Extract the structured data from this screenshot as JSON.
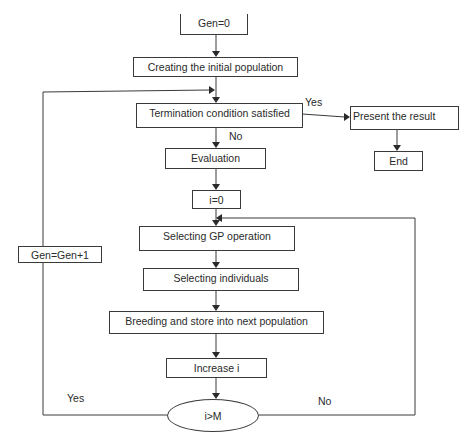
{
  "diagram": {
    "type": "flowchart",
    "nodes": {
      "gen_init": "Gen=0",
      "create_pop": "Creating the initial population",
      "termination": "Termination condition satisfied",
      "present": "Present the result",
      "end": "End",
      "evaluation": "Evaluation",
      "i_init": "i=0",
      "select_op": "Selecting GP operation",
      "select_ind": "Selecting individuals",
      "breeding": "Breeding and store into next population",
      "increase_i": "Increase i",
      "decision": "i>M",
      "gen_inc": "Gen=Gen+1"
    },
    "edge_labels": {
      "term_yes": "Yes",
      "term_no": "No",
      "loop_yes": "Yes",
      "loop_no": "No"
    },
    "edges": [
      {
        "from": "gen_init",
        "to": "create_pop"
      },
      {
        "from": "create_pop",
        "to": "termination"
      },
      {
        "from": "termination",
        "to": "present",
        "label": "Yes"
      },
      {
        "from": "present",
        "to": "end"
      },
      {
        "from": "termination",
        "to": "evaluation",
        "label": "No"
      },
      {
        "from": "evaluation",
        "to": "i_init"
      },
      {
        "from": "i_init",
        "to": "select_op"
      },
      {
        "from": "select_op",
        "to": "select_ind"
      },
      {
        "from": "select_ind",
        "to": "breeding"
      },
      {
        "from": "breeding",
        "to": "increase_i"
      },
      {
        "from": "increase_i",
        "to": "decision"
      },
      {
        "from": "decision",
        "to": "select_op",
        "label": "No"
      },
      {
        "from": "decision",
        "to": "gen_inc",
        "label": "Yes"
      },
      {
        "from": "gen_inc",
        "to": "termination"
      }
    ]
  }
}
